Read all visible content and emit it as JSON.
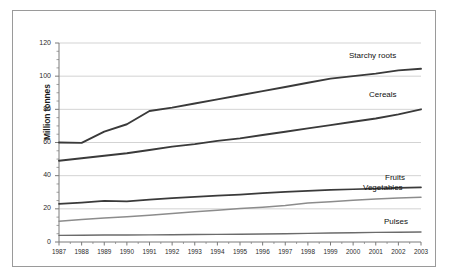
{
  "chart_data": {
    "type": "line",
    "title": "",
    "xlabel": "",
    "ylabel": "Million tonnes",
    "ylim": [
      0,
      120
    ],
    "yticks": [
      0,
      20,
      40,
      60,
      80,
      100,
      120
    ],
    "grid": true,
    "legend_position": "inline-right-of-line-ends",
    "x": [
      1987,
      1988,
      1989,
      1990,
      1991,
      1992,
      1993,
      1994,
      1995,
      1996,
      1997,
      1998,
      1999,
      2000,
      2001,
      2002,
      2003
    ],
    "categories": [
      "1987",
      "1988",
      "1989",
      "1990",
      "1991",
      "1992",
      "1993",
      "1994",
      "1995",
      "1996",
      "1997",
      "1998",
      "1999",
      "2000",
      "2001",
      "2002",
      "2003"
    ],
    "series": [
      {
        "name": "Starchy roots",
        "color": "#3a3a3a",
        "values": [
          60.0,
          59.8,
          66.5,
          71.0,
          79.0,
          81.0,
          83.5,
          86.0,
          88.5,
          91.0,
          93.5,
          96.0,
          98.5,
          100.0,
          101.5,
          103.5,
          104.5
        ]
      },
      {
        "name": "Cereals",
        "color": "#3a3a3a",
        "values": [
          49.0,
          50.5,
          52.0,
          53.5,
          55.5,
          57.5,
          59.0,
          61.0,
          62.5,
          64.5,
          66.5,
          68.5,
          70.5,
          72.5,
          74.5,
          77.0,
          80.0
        ]
      },
      {
        "name": "Fruits",
        "color": "#3a3a3a",
        "values": [
          23.0,
          23.8,
          24.8,
          24.5,
          25.5,
          26.5,
          27.2,
          28.0,
          28.6,
          29.5,
          30.2,
          30.8,
          31.4,
          31.8,
          32.2,
          32.6,
          33.0
        ]
      },
      {
        "name": "Vegetables",
        "color": "#8c8c8c",
        "values": [
          12.5,
          13.5,
          14.4,
          15.2,
          16.2,
          17.2,
          18.2,
          19.2,
          20.2,
          21.0,
          22.0,
          23.5,
          24.2,
          25.2,
          26.0,
          26.6,
          27.0
        ]
      },
      {
        "name": "Pulses",
        "color": "#6b6b6b",
        "values": [
          4.0,
          4.1,
          4.2,
          4.2,
          4.3,
          4.4,
          4.5,
          4.6,
          4.7,
          4.8,
          5.0,
          5.2,
          5.4,
          5.6,
          5.8,
          5.9,
          6.0
        ]
      }
    ]
  },
  "axis": {
    "y_title": "Million tonnes",
    "y_tick_labels": [
      "0",
      "20",
      "40",
      "60",
      "80",
      "100",
      "120"
    ],
    "x_tick_labels": [
      "1987",
      "1988",
      "1989",
      "1990",
      "1991",
      "1992",
      "1993",
      "1994",
      "1995",
      "1996",
      "1997",
      "1998",
      "1999",
      "2000",
      "2001",
      "2002",
      "2003"
    ]
  },
  "series_labels": [
    {
      "name": "Starchy roots",
      "text": "Starchy roots"
    },
    {
      "name": "Cereals",
      "text": "Cereals"
    },
    {
      "name": "Fruits",
      "text": "Fruits"
    },
    {
      "name": "Vegetables",
      "text": "Vegetables"
    },
    {
      "name": "Pulses",
      "text": "Pulses"
    }
  ],
  "colors": {
    "grid": "#c8c8c8",
    "axis": "#7a7a7a",
    "frame": "#9a9a9a",
    "text": "#1a1a1a",
    "background": "#ffffff"
  }
}
